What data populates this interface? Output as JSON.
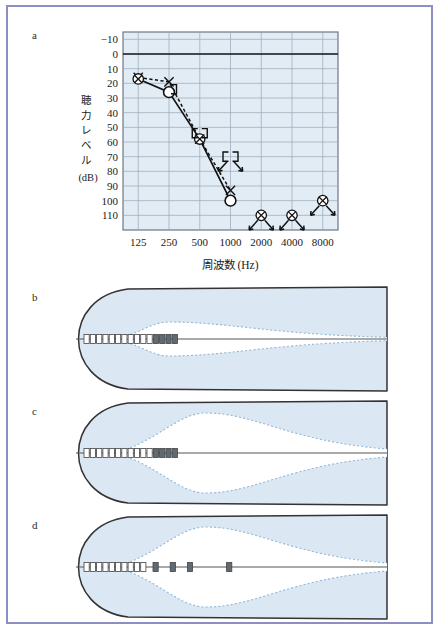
{
  "figure": {
    "panels": [
      {
        "id": "a",
        "label": "a"
      },
      {
        "id": "b",
        "label": "b"
      },
      {
        "id": "c",
        "label": "c"
      },
      {
        "id": "d",
        "label": "d"
      }
    ],
    "border_color": "#8d8fc4"
  },
  "chart_data": {
    "type": "line",
    "title": "",
    "xlabel": "周波数 (Hz)",
    "ylabel": "聴力レベル (dB)",
    "ylabel_vertical_chars": [
      "聴",
      "力",
      "レ",
      "ベ",
      "ル"
    ],
    "ylabel_unit": "(dB)",
    "xlabel_main": "周波数",
    "xlabel_unit": "(Hz)",
    "x_scale": "log2",
    "categories": [
      "125",
      "250",
      "500",
      "1000",
      "2000",
      "4000",
      "8000"
    ],
    "xticks": [
      125,
      250,
      500,
      1000,
      2000,
      4000,
      8000
    ],
    "yticks": [
      -10,
      0,
      10,
      20,
      30,
      40,
      50,
      60,
      70,
      80,
      90,
      100,
      110
    ],
    "ylim": [
      -15,
      120
    ],
    "y_inverted": true,
    "grid": true,
    "grid_color": "#9aa6b4",
    "plot_bg": "#e1ecf5",
    "zero_line_dB": 0,
    "legend_position": "none",
    "series": [
      {
        "name": "右耳 気導 (masked air conduction, circled-X)",
        "symbol": "circled-x",
        "line": "solid",
        "points": [
          {
            "freq": 125,
            "dB": 17,
            "scale_out": false
          },
          {
            "freq": 500,
            "dB": 58,
            "scale_out": false
          },
          {
            "freq": 2000,
            "dB": 110,
            "scale_out": true
          },
          {
            "freq": 4000,
            "dB": 110,
            "scale_out": true
          },
          {
            "freq": 8000,
            "dB": 100,
            "scale_out": true
          }
        ]
      },
      {
        "name": "左耳 気導 (unmasked air conduction, circle)",
        "symbol": "circle",
        "line": "solid",
        "points": [
          {
            "freq": 250,
            "dB": 26,
            "scale_out": false
          },
          {
            "freq": 1000,
            "dB": 100,
            "scale_out": false
          }
        ]
      },
      {
        "name": "気導 (X marker, dashed)",
        "symbol": "x",
        "line": "dashed",
        "points": [
          {
            "freq": 125,
            "dB": 16,
            "scale_out": false
          },
          {
            "freq": 250,
            "dB": 19,
            "scale_out": false
          },
          {
            "freq": 500,
            "dB": 58,
            "scale_out": false
          },
          {
            "freq": 1000,
            "dB": 93,
            "scale_out": false
          }
        ]
      },
      {
        "name": "骨導 マスキング (masked bone conduction, bracket)",
        "symbol": "bracket",
        "line": "none",
        "points": [
          {
            "freq": 250,
            "dB": 24,
            "side": "right",
            "scale_out": false
          },
          {
            "freq": 500,
            "dB": 54,
            "side": "left",
            "scale_out": false
          },
          {
            "freq": 500,
            "dB": 54,
            "side": "right",
            "scale_out": false
          },
          {
            "freq": 1000,
            "dB": 70,
            "side": "left",
            "scale_out": true
          },
          {
            "freq": 1000,
            "dB": 70,
            "side": "right",
            "scale_out": true
          }
        ]
      }
    ],
    "annotations": [
      {
        "type": "scale-out-arrow",
        "freq": 1000,
        "dB": 70,
        "direction": "down-left"
      },
      {
        "type": "scale-out-arrow",
        "freq": 1000,
        "dB": 70,
        "direction": "down-right"
      },
      {
        "type": "scale-out-arrow",
        "freq": 2000,
        "dB": 110,
        "direction": "down-left"
      },
      {
        "type": "scale-out-arrow",
        "freq": 2000,
        "dB": 110,
        "direction": "down-right"
      },
      {
        "type": "scale-out-arrow",
        "freq": 4000,
        "dB": 110,
        "direction": "down-left"
      },
      {
        "type": "scale-out-arrow",
        "freq": 4000,
        "dB": 110,
        "direction": "down-right"
      },
      {
        "type": "scale-out-arrow",
        "freq": 8000,
        "dB": 100,
        "direction": "down-left"
      },
      {
        "type": "scale-out-arrow",
        "freq": 8000,
        "dB": 100,
        "direction": "down-right"
      }
    ]
  },
  "cochlea": {
    "fill_color": "#dbe8f3",
    "outline_color": "#333333",
    "envelope_color": "#8fb8d8",
    "basilar_line_color": "#555555",
    "electrode_outline": "#444444",
    "electrode_active_fill": "#5f6a72",
    "panels": {
      "b": {
        "label": "b",
        "electrodes_inactive": 11,
        "electrodes_active": 4,
        "active_contiguous": true,
        "envelope_peak_rel": 0.3,
        "envelope_amplitude": "small",
        "description": "narrow traveling-wave envelope near the base, contiguous active electrodes"
      },
      "c": {
        "label": "c",
        "electrodes_inactive": 11,
        "electrodes_active": 4,
        "active_contiguous": true,
        "envelope_peak_rel": 0.42,
        "envelope_amplitude": "large",
        "description": "wide traveling-wave envelope, contiguous active electrodes"
      },
      "d": {
        "label": "d",
        "electrodes_inactive": 10,
        "electrodes_active": 4,
        "active_contiguous": false,
        "envelope_peak_rel": 0.42,
        "envelope_amplitude": "large",
        "description": "wide traveling-wave envelope, spaced-out active electrodes"
      }
    }
  }
}
